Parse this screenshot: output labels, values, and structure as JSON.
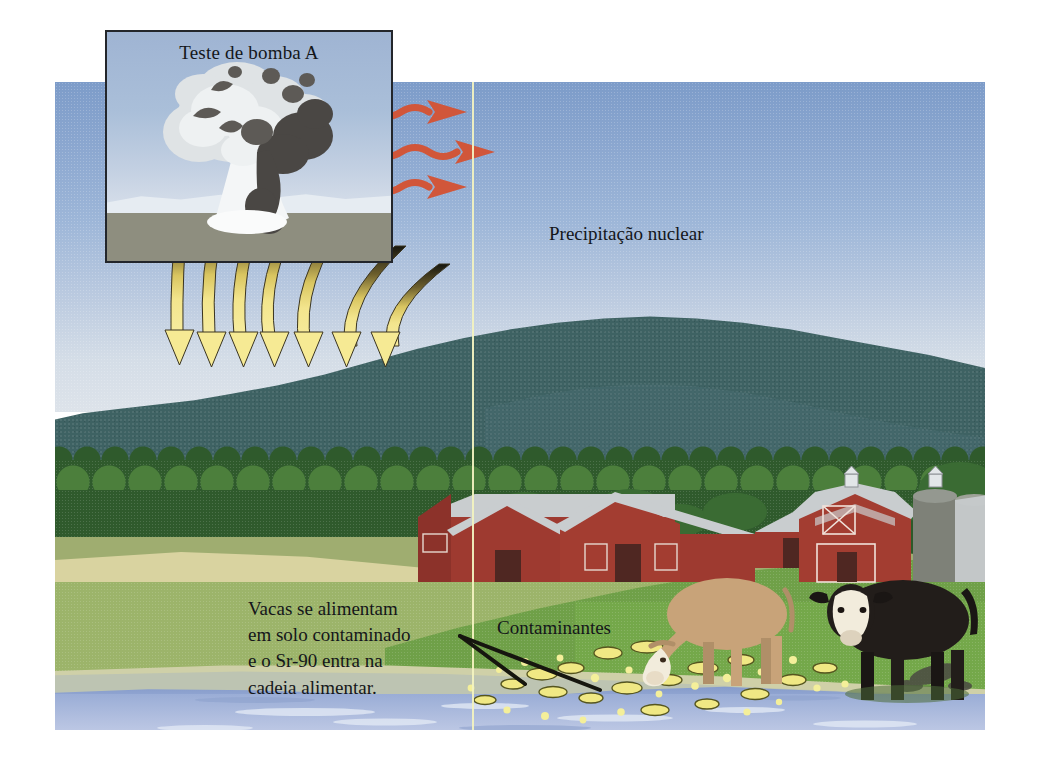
{
  "figure": {
    "type": "illustration",
    "language": "pt-BR"
  },
  "inset": {
    "title": "Teste de bomba A",
    "icon": "mushroom-cloud-icon",
    "border_color": "#23262b"
  },
  "labels": {
    "fallout": "Precipitação nuclear",
    "contaminants": "Contaminantes"
  },
  "caption": {
    "line1": "Vacas se alimentam",
    "line2": "em solo contaminado",
    "line3": "e o Sr-90 entra na",
    "line4": "cadeia alimentar."
  },
  "arrows": {
    "blast_wave_count": 3,
    "blast_wave_color": "#d1563a",
    "fallout_arrow_count": 7,
    "fallout_arrow_fill": "#f5e27a",
    "fallout_arrow_tip": "#1d1d1a"
  },
  "scene": {
    "sky_color": "#9db6d8",
    "hill_color": "#3e6263",
    "treeline_color": "#2f5a2c",
    "pasture_color": "#74a84a",
    "water_color": "#a8b8dc",
    "barn_color": "#9e3a30",
    "roof_color": "#c9cdcf",
    "silo_color": "#7e8178",
    "contaminant_color": "#f0e884",
    "gutter_line_color": "#f2f2c0"
  },
  "animals": [
    {
      "name": "grazing-cow",
      "coat": "#c8a379",
      "face": "#f2ecdc",
      "pose": "grazing"
    },
    {
      "name": "standing-cow",
      "coat": "#221d1a",
      "face": "#f2ecdc",
      "pose": "standing"
    }
  ],
  "buildings": [
    {
      "name": "long-barn-left",
      "color": "#9e3a30"
    },
    {
      "name": "barn-center",
      "color": "#9e3a30"
    },
    {
      "name": "barn-right",
      "color": "#9e3a30"
    },
    {
      "name": "main-barn",
      "color": "#a33d31"
    },
    {
      "name": "silo-left",
      "color": "#7e8178"
    },
    {
      "name": "silo-right",
      "color": "#8b8e85"
    }
  ]
}
